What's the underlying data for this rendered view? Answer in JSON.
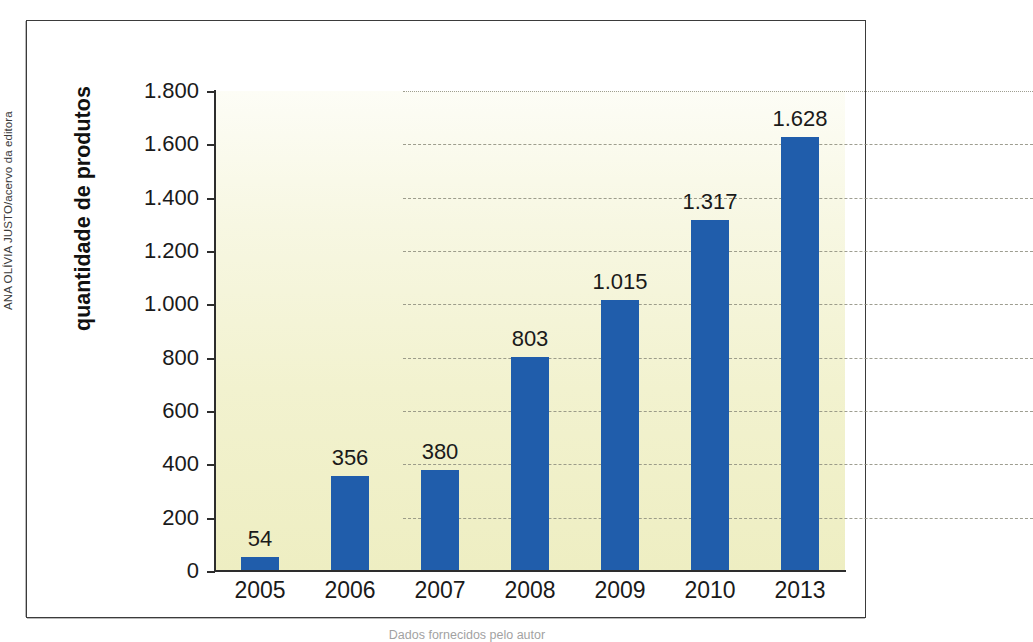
{
  "credit": {
    "text": "ANA OLÍVIA JUSTO/acervo da editora"
  },
  "caption": {
    "text": "Dados fornecidos pelo autor"
  },
  "colors": {
    "bar": "#205DAB",
    "plot_bg_top": "#fdfdf6",
    "plot_bg_bottom": "#eeeec2",
    "axis": "#2d2d2d",
    "gridline": "#8e8e7e"
  },
  "chart_data": {
    "type": "bar",
    "title": "",
    "xlabel": "",
    "ylabel": "quantidade de produtos",
    "categories": [
      "2005",
      "2006",
      "2007",
      "2008",
      "2009",
      "2010",
      "2013"
    ],
    "values": [
      54,
      356,
      380,
      803,
      1015,
      1317,
      1628
    ],
    "value_labels": [
      "54",
      "356",
      "380",
      "803",
      "1.015",
      "1.317",
      "1.628"
    ],
    "ylim": [
      0,
      1800
    ],
    "yticks": [
      0,
      200,
      400,
      600,
      800,
      1000,
      1200,
      1400,
      1600,
      1800
    ],
    "ytick_labels": [
      "0",
      "200",
      "400",
      "600",
      "800",
      "1.000",
      "1.200",
      "1.400",
      "1.600",
      "1.800"
    ],
    "grid": true,
    "legend": "none"
  }
}
